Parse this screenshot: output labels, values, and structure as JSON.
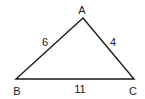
{
  "diagram": {
    "type": "triangle",
    "vertices": [
      {
        "name": "A",
        "x": 83,
        "y": 18
      },
      {
        "name": "B",
        "x": 16,
        "y": 79
      },
      {
        "name": "C",
        "x": 134,
        "y": 79
      }
    ],
    "sides": [
      {
        "between": "AB",
        "length": "6"
      },
      {
        "between": "AC",
        "length": "4"
      },
      {
        "between": "BC",
        "length": "11"
      }
    ],
    "labels": {
      "A": "A",
      "B": "B",
      "C": "C",
      "AB": "6",
      "AC": "4",
      "BC": "11"
    },
    "stroke_color": "#1a1a1a"
  }
}
